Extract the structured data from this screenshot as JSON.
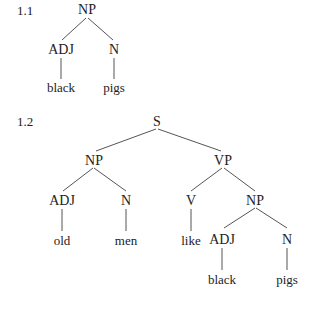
{
  "trees": [
    {
      "number": "1.1",
      "nodes": {
        "root": "NP",
        "adj": "ADJ",
        "n": "N",
        "adj_word": "black",
        "n_word": "pigs"
      }
    },
    {
      "number": "1.2",
      "nodes": {
        "root": "S",
        "np": "NP",
        "vp": "VP",
        "np_adj": "ADJ",
        "np_n": "N",
        "np_adj_word": "old",
        "np_n_word": "men",
        "v": "V",
        "v_word": "like",
        "vp_np": "NP",
        "vp_np_adj": "ADJ",
        "vp_np_n": "N",
        "vp_np_adj_word": "black",
        "vp_np_n_word": "pigs"
      }
    }
  ],
  "colors": {
    "text": "#222222",
    "line": "#444444",
    "background": "#ffffff"
  }
}
